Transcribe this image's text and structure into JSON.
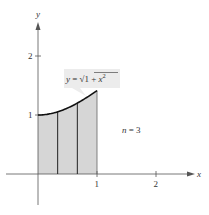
{
  "diagram": {
    "function_label": "y = √(1 + x²)",
    "function_label_parts": {
      "y": "y",
      "eq": " = ",
      "sqrt": "√",
      "inner": "1 + ",
      "x": "x",
      "exp": "2"
    },
    "annotation": {
      "n_var": "n",
      "rest": " = 3"
    },
    "axis_labels": {
      "x": "x",
      "y": "y"
    },
    "x_ticks": [
      {
        "value": 1,
        "label": "1"
      },
      {
        "value": 2,
        "label": "2"
      }
    ],
    "y_ticks": [
      {
        "value": 1,
        "label": "1"
      },
      {
        "value": 2,
        "label": "2"
      }
    ],
    "x_range": [
      -0.6,
      2.4
    ],
    "y_range": [
      -0.75,
      2.5
    ],
    "n": 3,
    "interval": [
      0,
      1
    ],
    "colors": {
      "fill": "#d6d6d6",
      "curve": "#111111",
      "axis": "#555555",
      "label_box": "#ececec"
    }
  }
}
